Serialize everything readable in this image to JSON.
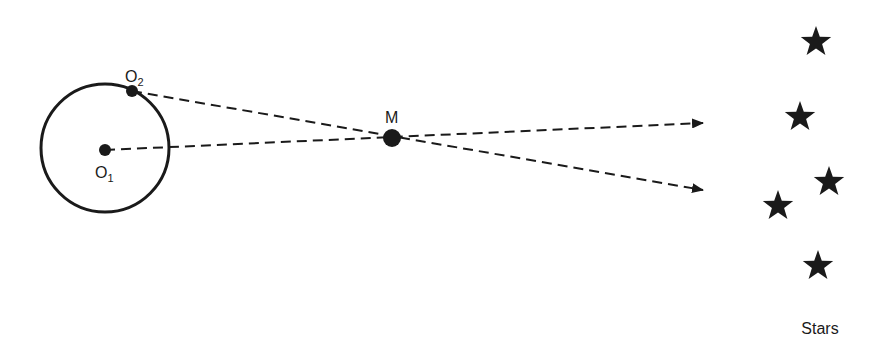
{
  "diagram": {
    "colors": {
      "ink": "#1a1a1a",
      "background": "#ffffff"
    },
    "circle": {
      "cx": 105,
      "cy": 148,
      "r": 64
    },
    "points": {
      "O1": {
        "x": 105,
        "y": 150,
        "label": "O",
        "sub": "1"
      },
      "O2": {
        "x": 132,
        "y": 91,
        "label": "O",
        "sub": "2"
      },
      "M": {
        "x": 392,
        "y": 138,
        "label": "M"
      }
    },
    "lines": [
      {
        "from": "O1",
        "through": "M",
        "to": {
          "x": 703,
          "y": 123
        }
      },
      {
        "from": "O2",
        "through": "M",
        "to": {
          "x": 703,
          "y": 190
        }
      }
    ],
    "stars": [
      {
        "x": 816,
        "y": 42
      },
      {
        "x": 800,
        "y": 117
      },
      {
        "x": 829,
        "y": 182
      },
      {
        "x": 778,
        "y": 206
      },
      {
        "x": 818,
        "y": 266
      }
    ],
    "stars_label": "Stars"
  }
}
